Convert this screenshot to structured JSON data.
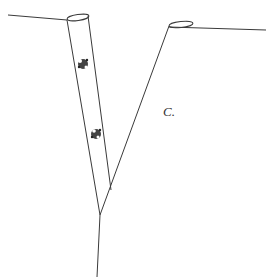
{
  "figure": {
    "label": "C.",
    "colors": {
      "line": "#3a3a3a",
      "background": "#ffffff",
      "marking": "#222222"
    },
    "elements": [
      "left-stalk",
      "right-stalk",
      "main-stem",
      "markings"
    ]
  }
}
